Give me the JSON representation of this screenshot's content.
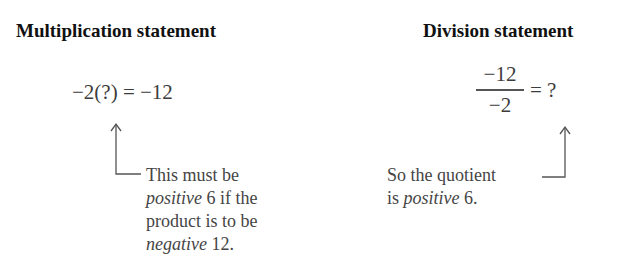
{
  "left": {
    "heading": "Multiplication statement",
    "equation": "−2(?) = −12",
    "annotation": {
      "line1": "This must be",
      "line2_italic": "positive",
      "line2_rest": " 6 if the",
      "line3": "product is to be",
      "line4_italic": "negative",
      "line4_rest": " 12."
    }
  },
  "right": {
    "heading": "Division statement",
    "fraction": {
      "numerator": "−12",
      "denominator": "−2"
    },
    "equals": "= ?",
    "annotation": {
      "line1": "So the quotient",
      "line2_pre": "is ",
      "line2_italic": "positive",
      "line2_rest": " 6."
    }
  },
  "colors": {
    "heading": "#111111",
    "body_text": "#454545",
    "arrow": "#555555"
  }
}
